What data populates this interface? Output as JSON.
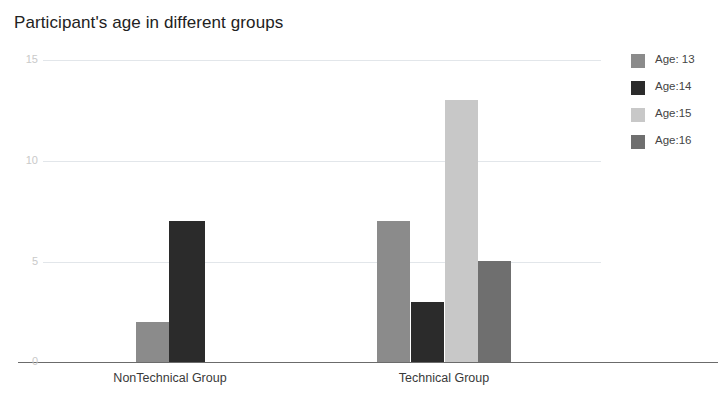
{
  "chart_data": {
    "type": "bar",
    "title": "Participant's age in different groups",
    "xlabel": "",
    "ylabel": "",
    "categories": [
      "NonTechnical Group",
      "Technical Group"
    ],
    "series": [
      {
        "name": "Age: 13",
        "color": "#8b8b8b",
        "values": [
          2,
          7
        ]
      },
      {
        "name": "Age:14",
        "color": "#2b2b2b",
        "values": [
          7,
          3
        ]
      },
      {
        "name": "Age:15",
        "color": "#c8c8c8",
        "values": [
          0,
          13
        ]
      },
      {
        "name": "Age:16",
        "color": "#6f6f6f",
        "values": [
          0,
          5
        ]
      }
    ],
    "ylim": [
      0,
      15
    ],
    "yticks": [
      0,
      5,
      10,
      15
    ],
    "ytick_labels": [
      "0",
      "5",
      "10",
      "15"
    ],
    "grid": true,
    "legend_position": "right",
    "axis_color": "#6b6b6b",
    "grid_color": "#e2e6ea",
    "tick_label_color": "#c9c9c9"
  }
}
